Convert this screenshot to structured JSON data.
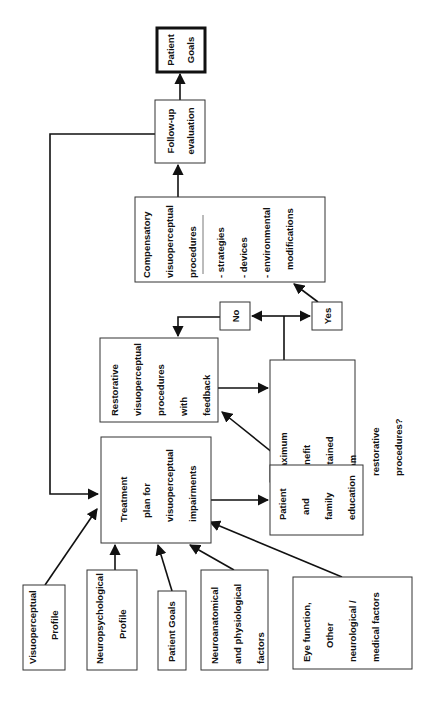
{
  "diagram": {
    "orientation": "rotated-90-ccw",
    "nodes": {
      "patient_goals_final": {
        "lines": [
          "Patient",
          "Goals"
        ],
        "emphasis": "bold-border"
      },
      "follow_up": {
        "lines": [
          "Follow-up",
          "evaluation"
        ]
      },
      "compensatory": {
        "lines": [
          "Compensatory",
          "visuoperceptual",
          "procedures"
        ],
        "sub_items": [
          "- strategies",
          "- devices",
          "- environmental",
          "modifications"
        ]
      },
      "no": {
        "lines": [
          "No"
        ]
      },
      "yes": {
        "lines": [
          "Yes"
        ]
      },
      "restorative": {
        "lines": [
          "Restorative",
          "visuoperceptual",
          "procedures",
          "with",
          "feedback"
        ]
      },
      "maximum_benefit": {
        "lines": [
          "Maximum",
          "benefit",
          "obtained",
          "from",
          "restorative",
          "procedures?"
        ]
      },
      "treatment_plan": {
        "lines": [
          "Treatment",
          "plan for",
          "visuoperceptual",
          "impairments"
        ]
      },
      "education": {
        "lines": [
          "Patient",
          "and",
          "family",
          "education"
        ]
      },
      "visuoperceptual_profile": {
        "lines": [
          "Visuoperceptual",
          "Profile"
        ]
      },
      "neuropsychological_profile": {
        "lines": [
          "Neuropsychological",
          "Profile"
        ]
      },
      "patient_goals_input": {
        "lines": [
          "Patient Goals"
        ]
      },
      "neuroanatomical": {
        "lines": [
          "Neuroanatomical",
          "and physiological",
          "factors"
        ]
      },
      "eye_function": {
        "lines": [
          "Eye function,",
          "Other",
          "neurological /",
          "medical factors"
        ]
      }
    },
    "edges": [
      {
        "from": "visuoperceptual_profile",
        "to": "treatment_plan"
      },
      {
        "from": "neuropsychological_profile",
        "to": "treatment_plan"
      },
      {
        "from": "patient_goals_input",
        "to": "treatment_plan"
      },
      {
        "from": "neuroanatomical",
        "to": "treatment_plan"
      },
      {
        "from": "eye_function",
        "to": "treatment_plan"
      },
      {
        "from": "treatment_plan",
        "to": "education"
      },
      {
        "from": "education",
        "to": "restorative"
      },
      {
        "from": "restorative",
        "to": "maximum_benefit"
      },
      {
        "from": "maximum_benefit",
        "to": "no"
      },
      {
        "from": "maximum_benefit",
        "to": "yes"
      },
      {
        "from": "no",
        "to": "restorative"
      },
      {
        "from": "yes",
        "to": "compensatory"
      },
      {
        "from": "compensatory",
        "to": "follow_up"
      },
      {
        "from": "follow_up",
        "to": "patient_goals_final"
      },
      {
        "from": "follow_up",
        "to": "treatment_plan"
      }
    ]
  }
}
